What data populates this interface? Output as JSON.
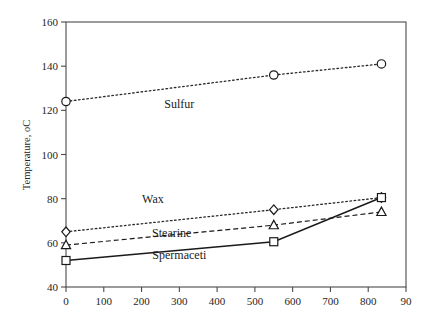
{
  "chart_data": {
    "type": "line",
    "title": "",
    "xlabel": "",
    "ylabel": "Temperature, oC",
    "xlim": [
      0,
      900
    ],
    "ylim": [
      40,
      160
    ],
    "xticks": [
      0,
      100,
      200,
      300,
      400,
      500,
      600,
      700,
      800,
      900
    ],
    "xtick_labels": [
      "0",
      "100",
      "200",
      "300",
      "400",
      "500",
      "600",
      "700",
      "800",
      "90"
    ],
    "yticks": [
      40,
      60,
      80,
      100,
      120,
      140,
      160
    ],
    "ytick_labels": [
      "40",
      "60",
      "80",
      "100",
      "120",
      "140",
      "160"
    ],
    "grid": false,
    "legend_position": "inline-annotations",
    "series": [
      {
        "name": "Sulfur",
        "marker": "circle",
        "linestyle": "dotted",
        "x": [
          0,
          550,
          835
        ],
        "values": [
          124,
          136,
          141
        ],
        "label_x": 300,
        "label_y": 121
      },
      {
        "name": "Wax",
        "marker": "diamond",
        "linestyle": "dotted",
        "x": [
          0,
          550,
          835
        ],
        "values": [
          65,
          75,
          80.5
        ],
        "label_x": 230,
        "label_y": 78
      },
      {
        "name": "Stearine",
        "marker": "triangle",
        "linestyle": "dashed",
        "x": [
          0,
          550,
          835
        ],
        "values": [
          59,
          68,
          74
        ],
        "label_x": 280,
        "label_y": 62.5
      },
      {
        "name": "Spermaceti",
        "marker": "square",
        "linestyle": "solid",
        "x": [
          0,
          550,
          835
        ],
        "values": [
          52,
          60.5,
          80.5
        ],
        "label_x": 300,
        "label_y": 52.5
      }
    ]
  },
  "axes": {
    "y_axis_title": "Temperature, oC"
  }
}
